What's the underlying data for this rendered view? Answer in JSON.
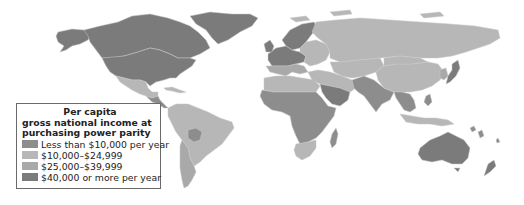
{
  "legend": {
    "title_lines": [
      "Per capita",
      "gross national income at",
      "purchasing power parity"
    ],
    "items": [
      {
        "label": "Less than $10,000 per year",
        "color": "#8d8d8d",
        "key": "low"
      },
      {
        "label": "$10,000–$24,999",
        "color": "#b7b7b7",
        "key": "lower_middle"
      },
      {
        "label": "$25,000–$39,999",
        "color": "#a9a9a9",
        "key": "upper_middle"
      },
      {
        "label": "$40,000 or more per year",
        "color": "#7b7b7b",
        "key": "high"
      }
    ]
  },
  "regions": [
    {
      "name": "alaska",
      "category": "high"
    },
    {
      "name": "canada",
      "category": "high"
    },
    {
      "name": "greenland",
      "category": "high"
    },
    {
      "name": "united-states",
      "category": "high"
    },
    {
      "name": "mexico",
      "category": "lower_middle"
    },
    {
      "name": "central-america",
      "category": "low"
    },
    {
      "name": "caribbean",
      "category": "lower_middle"
    },
    {
      "name": "south-america",
      "category": "lower_middle"
    },
    {
      "name": "bolivia",
      "category": "low"
    },
    {
      "name": "chile-argentina",
      "category": "upper_middle"
    },
    {
      "name": "northern-europe",
      "category": "high"
    },
    {
      "name": "western-europe",
      "category": "high"
    },
    {
      "name": "southern-europe",
      "category": "upper_middle"
    },
    {
      "name": "eastern-europe",
      "category": "lower_middle"
    },
    {
      "name": "russia",
      "category": "lower_middle"
    },
    {
      "name": "central-asia",
      "category": "lower_middle"
    },
    {
      "name": "middle-east",
      "category": "lower_middle"
    },
    {
      "name": "arabian-gulf",
      "category": "high"
    },
    {
      "name": "north-africa",
      "category": "lower_middle"
    },
    {
      "name": "sub-saharan-africa",
      "category": "low"
    },
    {
      "name": "southern-africa",
      "category": "lower_middle"
    },
    {
      "name": "madagascar",
      "category": "low"
    },
    {
      "name": "south-asia",
      "category": "low"
    },
    {
      "name": "china",
      "category": "lower_middle"
    },
    {
      "name": "mongolia",
      "category": "lower_middle"
    },
    {
      "name": "japan",
      "category": "high"
    },
    {
      "name": "korea",
      "category": "upper_middle"
    },
    {
      "name": "southeast-asia",
      "category": "low"
    },
    {
      "name": "indonesia",
      "category": "lower_middle"
    },
    {
      "name": "australia",
      "category": "high"
    },
    {
      "name": "new-zealand",
      "category": "high"
    },
    {
      "name": "pacific-islands",
      "category": "low"
    }
  ]
}
